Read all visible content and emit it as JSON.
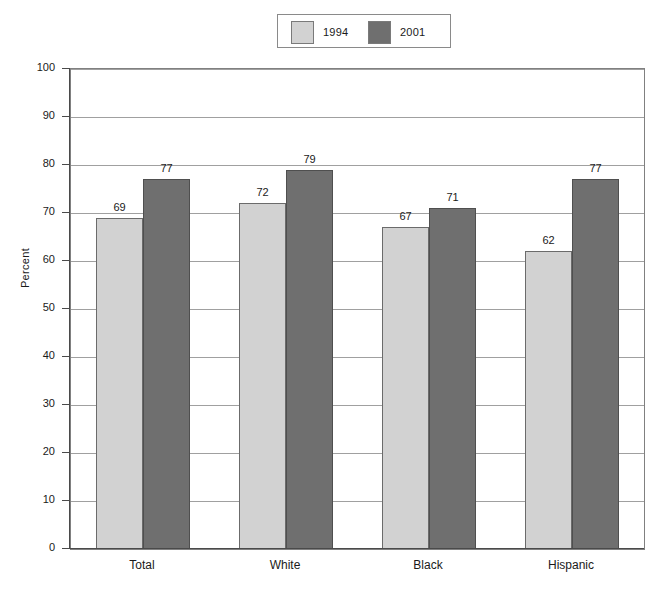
{
  "chart_data": {
    "type": "bar",
    "title": "",
    "xlabel": "",
    "ylabel": "Percent",
    "ylim": [
      0,
      100
    ],
    "ytick_step": 10,
    "yticks": [
      "100",
      "90",
      "80",
      "70",
      "60",
      "50",
      "40",
      "30",
      "20",
      "10",
      "0"
    ],
    "grid": true,
    "grid_axis": "y",
    "legend_position": "top-center",
    "categories": [
      "Total",
      "White",
      "Black",
      "Hispanic"
    ],
    "series": [
      {
        "name": "1994",
        "color": "#d2d2d2",
        "values": [
          69,
          72,
          67,
          62
        ],
        "labels": [
          "69",
          "72",
          "67",
          "62"
        ]
      },
      {
        "name": "2001",
        "color": "#6f6f6f",
        "values": [
          77,
          79,
          71,
          77
        ],
        "labels": [
          "77",
          "79",
          "71",
          "77"
        ]
      }
    ]
  },
  "legend": {
    "entries": [
      {
        "label": "1994",
        "color": "#d2d2d2"
      },
      {
        "label": "2001",
        "color": "#6f6f6f"
      }
    ]
  },
  "axes": {
    "y_title": "Percent",
    "y_ticks": [
      "100",
      "90",
      "80",
      "70",
      "60",
      "50",
      "40",
      "30",
      "20",
      "10",
      "0"
    ],
    "x_ticks": [
      "Total",
      "White",
      "Black",
      "Hispanic"
    ]
  }
}
